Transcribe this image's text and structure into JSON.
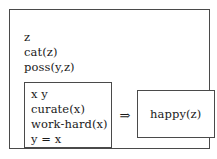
{
  "diagram": {
    "type": "implication-rule",
    "outer_box": {
      "name": "rule-frame"
    },
    "context": {
      "lines": [
        {
          "text": "z"
        },
        {
          "text": "cat(z)"
        },
        {
          "text": "poss(y,z)"
        }
      ]
    },
    "antecedent": {
      "lines": [
        {
          "text": "x y"
        },
        {
          "text": "curate(x)"
        },
        {
          "text": "work-hard(x)"
        },
        {
          "text": "y = x"
        }
      ]
    },
    "operator": {
      "symbol": "⇒",
      "name": "implies"
    },
    "consequent": {
      "text": "happy(z)"
    },
    "colors": {
      "background": "#ffffff",
      "border": "#4a4a4a",
      "text": "#1a1a1a"
    }
  }
}
